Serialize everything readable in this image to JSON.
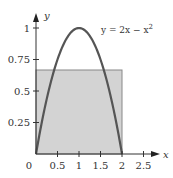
{
  "chart_data": {
    "type": "line",
    "title": "",
    "xlabel": "x",
    "ylabel": "y",
    "xlim": [
      0,
      2.5
    ],
    "ylim": [
      0,
      1
    ],
    "grid": false,
    "x_ticks": [
      "0",
      "0.5",
      "1",
      "1.5",
      "2",
      "2.5"
    ],
    "y_ticks": [
      "0.25",
      "0.5",
      "0.75",
      "1"
    ],
    "series": [
      {
        "name": "y = 2x − x²",
        "function": "2x - x^2",
        "x": [
          0,
          0.25,
          0.5,
          0.75,
          1,
          1.25,
          1.5,
          1.75,
          2
        ],
        "y": [
          0,
          0.4375,
          0.75,
          0.9375,
          1,
          0.9375,
          0.75,
          0.4375,
          0
        ]
      }
    ],
    "shaded_rectangle": {
      "x0": 0,
      "x1": 2,
      "y0": 0,
      "y1": 0.6667,
      "description": "average value rectangle"
    },
    "annotation": {
      "text": "y = 2x − x",
      "superscript": "2"
    },
    "colors": {
      "curve": "#555555",
      "rect_fill": "#d3d3d3",
      "rect_stroke": "#888888",
      "axis": "#333333"
    }
  }
}
